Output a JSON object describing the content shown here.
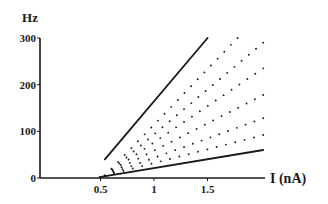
{
  "chart_data": {
    "type": "line",
    "title": "",
    "xlabel": "I (nA)",
    "ylabel": "Hz",
    "xlim": [
      0,
      2.03
    ],
    "ylim": [
      0,
      300
    ],
    "x_ticks": [
      0.5,
      1,
      1.5
    ],
    "x_tick_labels": [
      "0.5",
      "1",
      "1.5"
    ],
    "y_ticks": [
      0,
      100,
      200,
      300
    ],
    "y_tick_labels": [
      "0",
      "100",
      "200",
      "300"
    ],
    "grid": false,
    "legend": null,
    "series": [
      {
        "name": "solid-steep",
        "style": "solid",
        "x": [
          0.55,
          1.51
        ],
        "values": [
          40,
          300
        ]
      },
      {
        "name": "dotted-1",
        "style": "dotted",
        "x": [
          0.55,
          1.79
        ],
        "values": [
          5,
          300
        ]
      },
      {
        "name": "dotted-2",
        "style": "dotted",
        "x": [
          0.55,
          2.03
        ],
        "values": [
          5,
          290
        ]
      },
      {
        "name": "dotted-3",
        "style": "dotted",
        "x": [
          0.55,
          2.03
        ],
        "values": [
          5,
          235
        ]
      },
      {
        "name": "dotted-4",
        "style": "dotted",
        "x": [
          0.55,
          2.03
        ],
        "values": [
          5,
          178
        ]
      },
      {
        "name": "dotted-5",
        "style": "dotted",
        "x": [
          0.55,
          2.03
        ],
        "values": [
          5,
          128
        ]
      },
      {
        "name": "dotted-6",
        "style": "dotted",
        "x": [
          0.55,
          2.03
        ],
        "values": [
          5,
          92
        ]
      },
      {
        "name": "solid-shallow",
        "style": "solid",
        "x": [
          0.5,
          2.03
        ],
        "values": [
          2,
          60
        ]
      }
    ]
  },
  "layout": {
    "origin_px": [
      46,
      178
    ],
    "px_per_nA": 107,
    "px_per_Hz": 0.4667,
    "x_axis_end_px": 265,
    "y_axis_top_px": 38,
    "line_color": "#1a1a1a"
  }
}
